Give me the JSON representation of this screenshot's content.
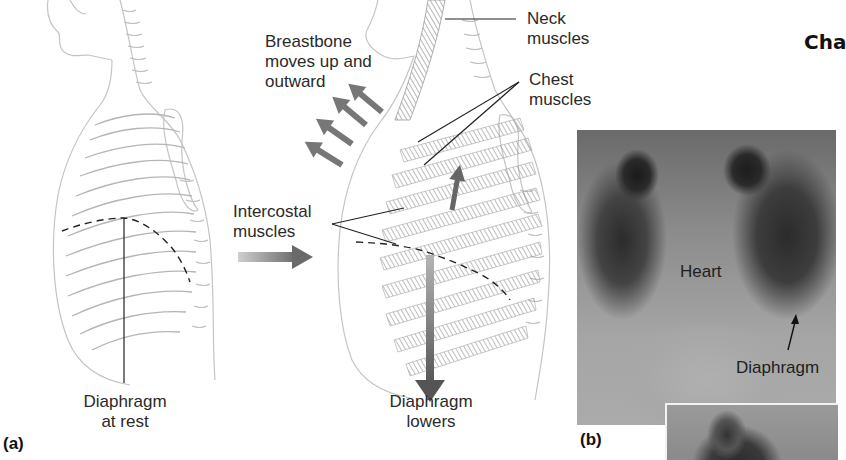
{
  "figure": {
    "heading_partial": "Cha",
    "panel_a": {
      "tag": "(a)",
      "labels": {
        "breastbone": [
          "Breastbone",
          "moves up and",
          "outward"
        ],
        "intercostal": [
          "Intercostal",
          "muscles"
        ],
        "diaphragm_rest": [
          "Diaphragm",
          "at rest"
        ],
        "diaphragm_lowers": [
          "Diaphragm",
          "lowers"
        ],
        "neck_muscles": [
          "Neck",
          "muscles"
        ],
        "chest_muscles": [
          "Chest",
          "muscles"
        ]
      }
    },
    "panel_b": {
      "tag": "(b)",
      "labels": {
        "heart": "Heart",
        "diaphragm": "Diaphragm"
      }
    },
    "colors": {
      "line": "#222222",
      "arrow": "#6e6e6e",
      "sketch": "#c9c9c9",
      "muscle": "#9a9a9a"
    }
  }
}
